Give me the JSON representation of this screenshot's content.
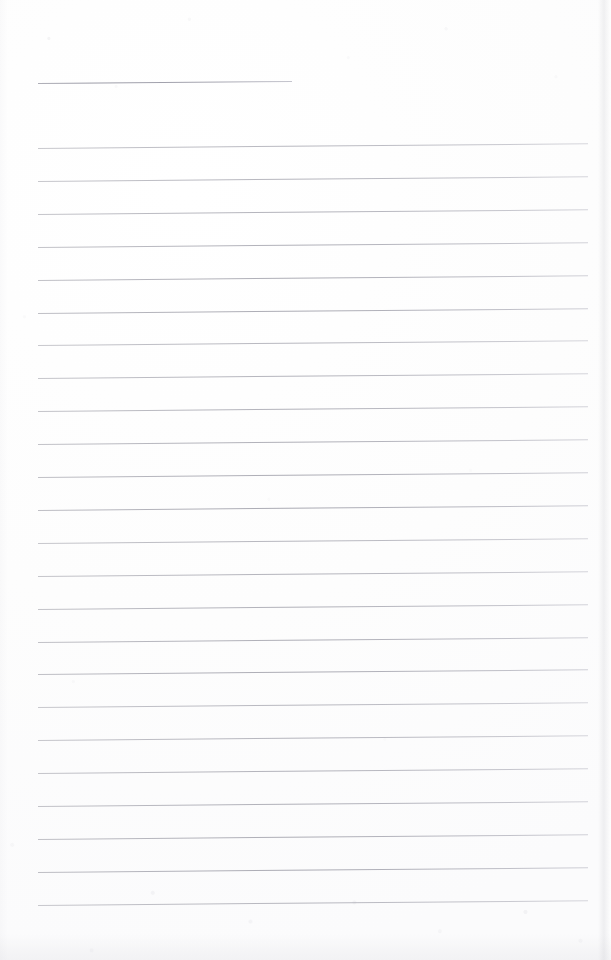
{
  "document": {
    "kind": "scanned-lined-notebook-page",
    "title": "Blank ruled notebook page",
    "page_width": 611,
    "page_height": 960,
    "background_color": "#fdfdfd",
    "rule_color": "#a8a8b0",
    "text_content": "",
    "status": "No text or handwriting present on page"
  },
  "rules": {
    "short_rule": {
      "label": "short top rule",
      "x": 38,
      "y": 83,
      "length": 254,
      "angle_deg": -0.45
    },
    "full_rules": {
      "label": "full-width ruled lines",
      "count": 24,
      "x": 38,
      "first_y": 148,
      "spacing": 32.9,
      "length": 550,
      "angle_deg": -0.5
    }
  }
}
